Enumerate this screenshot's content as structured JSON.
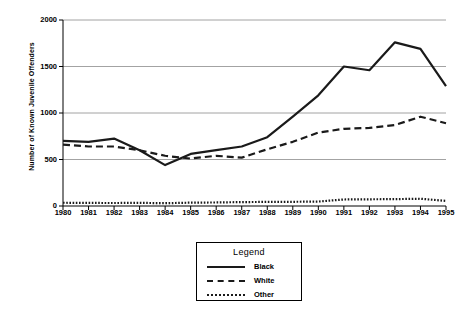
{
  "chart_data": {
    "type": "line",
    "title": "",
    "xlabel": "",
    "ylabel": "Number of Known Juvenile Offenders",
    "categories": [
      "1980",
      "1981",
      "1982",
      "1983",
      "1984",
      "1985",
      "1986",
      "1987",
      "1988",
      "1989",
      "1990",
      "1991",
      "1992",
      "1993",
      "1994",
      "1995"
    ],
    "x": [
      1980,
      1981,
      1982,
      1983,
      1984,
      1985,
      1986,
      1987,
      1988,
      1989,
      1990,
      1991,
      1992,
      1993,
      1994,
      1995
    ],
    "ylim": [
      0,
      2000
    ],
    "xlim": [
      1980,
      1995
    ],
    "yticks": [
      0,
      500,
      1000,
      1500,
      2000
    ],
    "ytick_labels": [
      "0",
      "500",
      "1000",
      "1500",
      "2000"
    ],
    "grid": true,
    "grid_axis": "y",
    "legend_position": "below-center",
    "legend_title": "Legend",
    "series": [
      {
        "name": "Black",
        "style": "solid",
        "color": "#1a1a1a",
        "values": [
          700,
          690,
          725,
          600,
          440,
          560,
          600,
          640,
          740,
          960,
          1190,
          1500,
          1460,
          1760,
          1690,
          1290
        ]
      },
      {
        "name": "White",
        "style": "dashed",
        "color": "#1a1a1a",
        "values": [
          660,
          640,
          640,
          600,
          540,
          510,
          540,
          520,
          610,
          690,
          790,
          830,
          840,
          870,
          960,
          890
        ]
      },
      {
        "name": "Other",
        "style": "dotted",
        "color": "#1a1a1a",
        "values": [
          35,
          33,
          32,
          34,
          30,
          36,
          38,
          42,
          44,
          45,
          48,
          70,
          72,
          74,
          78,
          55
        ]
      }
    ]
  },
  "legend": {
    "title": "Legend",
    "items": [
      {
        "label": "Black",
        "style": "solid"
      },
      {
        "label": "White",
        "style": "dashed"
      },
      {
        "label": "Other",
        "style": "dotted"
      }
    ]
  }
}
